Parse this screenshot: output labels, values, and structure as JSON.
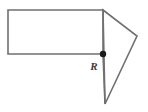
{
  "figure": {
    "background_color": "#ffffff",
    "stroke_color": "#707070",
    "stroke_width": 1.6,
    "marker_color": "#1c1c1c",
    "label_color": "#3a3a3a",
    "canvas": {
      "width": 148,
      "height": 112
    },
    "shapes": {
      "rectangle": {
        "name": "rectangle",
        "x": 8,
        "y": 10,
        "width": 95,
        "height": 44,
        "points": "8,10 103,10 103,54 8,54"
      },
      "triangle": {
        "name": "triangle",
        "points": "103,10 137,36 105,104"
      },
      "segment_down": {
        "name": "vertical-segment",
        "x1": 103,
        "y1": 54,
        "x2": 105,
        "y2": 104
      }
    },
    "points": [
      {
        "id": "R",
        "label": "R",
        "cx": 103,
        "cy": 54,
        "radius": 3.2,
        "label_x": 94,
        "label_y": 70
      }
    ]
  }
}
